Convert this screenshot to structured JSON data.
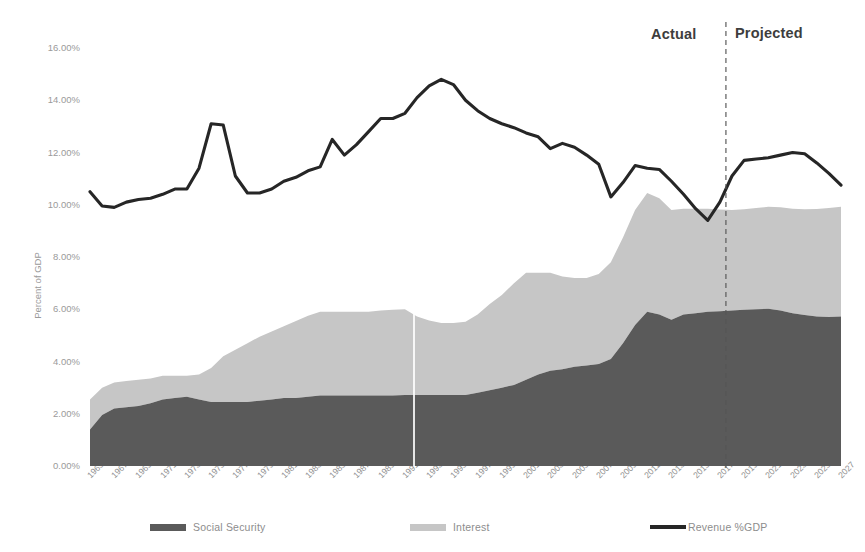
{
  "annotations": {
    "actual": "Actual",
    "projected": "Projected",
    "divider_year": 2017.5
  },
  "axes": {
    "ylabel": "Percent of GDP",
    "yticks": [
      "0.00%",
      "2.00%",
      "4.00%",
      "6.00%",
      "8.00%",
      "10.00%",
      "12.00%",
      "14.00%",
      "16.00%"
    ],
    "ytick_values": [
      0,
      2,
      4,
      6,
      8,
      10,
      12,
      14,
      16
    ],
    "xticks": [
      "1965",
      "1967",
      "1969",
      "1971",
      "1973",
      "1975",
      "1977",
      "1979",
      "1981",
      "1983",
      "1985",
      "1987",
      "1989",
      "1991",
      "1993",
      "1995",
      "1997",
      "1999",
      "2001",
      "2003",
      "2005",
      "2007",
      "2009",
      "2011",
      "2013",
      "2015",
      "2017",
      "2019",
      "2021",
      "2023",
      "2025",
      "2027"
    ]
  },
  "legend": [
    {
      "label": "Social Security",
      "type": "area",
      "color": "#5a5a5a"
    },
    {
      "label": "Interest",
      "type": "area",
      "color": "#c6c6c6"
    },
    {
      "label": "Revenue %GDP",
      "type": "line",
      "color": "#262626"
    }
  ],
  "chart_data": {
    "type": "area",
    "title": "",
    "xlabel": "",
    "ylabel": "Percent of GDP",
    "ylim": [
      0,
      16
    ],
    "xlim": [
      1965,
      2027
    ],
    "grid": false,
    "legend_position": "bottom",
    "stacked": true,
    "x": [
      1965,
      1966,
      1967,
      1968,
      1969,
      1970,
      1971,
      1972,
      1973,
      1974,
      1975,
      1976,
      1977,
      1978,
      1979,
      1980,
      1981,
      1982,
      1983,
      1984,
      1985,
      1986,
      1987,
      1988,
      1989,
      1990,
      1991,
      1992,
      1993,
      1994,
      1995,
      1996,
      1997,
      1998,
      1999,
      2000,
      2001,
      2002,
      2003,
      2004,
      2005,
      2006,
      2007,
      2008,
      2009,
      2010,
      2011,
      2012,
      2013,
      2014,
      2015,
      2016,
      2017,
      2018,
      2019,
      2020,
      2021,
      2022,
      2023,
      2024,
      2025,
      2026,
      2027
    ],
    "series": [
      {
        "name": "Social Security",
        "stack_order": 1,
        "color": "#5a5a5a",
        "values": [
          1.4,
          1.95,
          2.2,
          2.25,
          2.3,
          2.4,
          2.55,
          2.6,
          2.65,
          2.55,
          2.45,
          2.45,
          2.45,
          2.45,
          2.5,
          2.55,
          2.6,
          2.6,
          2.65,
          2.7,
          2.7,
          2.7,
          2.7,
          2.7,
          2.7,
          2.7,
          2.72,
          2.72,
          2.72,
          2.72,
          2.72,
          2.72,
          2.8,
          2.9,
          3.0,
          3.1,
          3.3,
          3.5,
          3.65,
          3.7,
          3.8,
          3.85,
          3.9,
          4.1,
          4.7,
          5.4,
          5.9,
          5.8,
          5.6,
          5.8,
          5.85,
          5.9,
          5.92,
          5.95,
          5.98,
          6.0,
          6.02,
          5.95,
          5.85,
          5.78,
          5.72,
          5.7,
          5.72
        ]
      },
      {
        "name": "Interest",
        "stack_order": 2,
        "color": "#c6c6c6",
        "values": [
          1.15,
          1.05,
          1.0,
          1.0,
          1.0,
          0.95,
          0.9,
          0.85,
          0.8,
          0.95,
          1.3,
          1.75,
          2.0,
          2.25,
          2.45,
          2.6,
          2.75,
          2.95,
          3.1,
          3.2,
          3.2,
          3.2,
          3.2,
          3.2,
          3.25,
          3.28,
          3.28,
          3.0,
          2.85,
          2.75,
          2.75,
          2.8,
          3.0,
          3.3,
          3.55,
          3.9,
          4.1,
          3.9,
          3.75,
          3.55,
          3.4,
          3.35,
          3.45,
          3.7,
          4.05,
          4.4,
          4.55,
          4.45,
          4.2,
          4.05,
          4.0,
          3.95,
          3.9,
          3.85,
          3.85,
          3.88,
          3.9,
          3.95,
          4.0,
          4.05,
          4.12,
          4.18,
          4.2
        ]
      }
    ],
    "line_series": [
      {
        "name": "Revenue %GDP",
        "color": "#262626",
        "values": [
          10.5,
          9.95,
          9.9,
          10.1,
          10.2,
          10.25,
          10.4,
          10.6,
          10.6,
          11.4,
          13.1,
          13.05,
          11.1,
          10.45,
          10.45,
          10.6,
          10.9,
          11.05,
          11.3,
          11.45,
          12.5,
          11.9,
          12.3,
          12.8,
          13.3,
          13.3,
          13.5,
          14.1,
          14.55,
          14.8,
          14.6,
          14.0,
          13.6,
          13.3,
          13.1,
          12.95,
          12.75,
          12.6,
          12.15,
          12.35,
          12.2,
          11.9,
          11.55,
          10.3,
          10.85,
          11.5,
          11.4,
          11.35,
          10.9,
          10.4,
          9.85,
          9.4,
          10.1,
          11.1,
          11.7,
          11.75,
          11.8,
          11.9,
          12.0,
          11.95,
          11.6,
          11.2,
          10.75
        ]
      }
    ]
  }
}
